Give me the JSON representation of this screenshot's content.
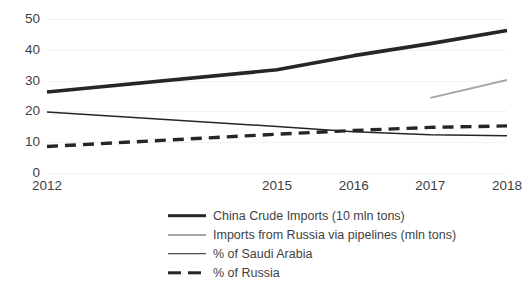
{
  "chart_data": {
    "type": "line",
    "title": "",
    "subtitle": "",
    "xlabel": "",
    "ylabel": "",
    "x": [
      "2012",
      "2015",
      "2016",
      "2017",
      "2018"
    ],
    "categories": [
      "2012",
      "2015",
      "2016",
      "2017",
      "2018"
    ],
    "xlim": [
      2012,
      2018
    ],
    "ylim": [
      0,
      50
    ],
    "yticks": [
      0,
      10,
      20,
      30,
      40,
      50
    ],
    "ytick_labels": [
      "0",
      "10",
      "20",
      "30",
      "40",
      "50"
    ],
    "xtick_labels": [
      "2012",
      "2015",
      "2016",
      "2017",
      "2018"
    ],
    "grid": "horizontal",
    "legend_position": "bottom",
    "series": [
      {
        "name": "China Crude Imports (10 mln tons)",
        "style": "solid-thick",
        "color": "#262626",
        "x": [
          2012,
          2015,
          2016,
          2017,
          2018
        ],
        "values": [
          26.3,
          33.5,
          38.1,
          42.0,
          46.3
        ]
      },
      {
        "name": "Imports from Russia via pipelines (mln tons)",
        "style": "solid-gray",
        "color": "#a6a6a6",
        "x": [
          2017,
          2018
        ],
        "values": [
          24.4,
          30.2
        ]
      },
      {
        "name": "% of Saudi Arabia",
        "style": "solid-thin",
        "color": "#262626",
        "x": [
          2012,
          2015,
          2016,
          2017,
          2018
        ],
        "values": [
          19.8,
          15.1,
          13.4,
          12.4,
          12.1
        ]
      },
      {
        "name": "% of Russia",
        "style": "dashed",
        "color": "#262626",
        "x": [
          2012,
          2015,
          2016,
          2017,
          2018
        ],
        "values": [
          8.6,
          12.6,
          13.8,
          14.8,
          15.3
        ]
      }
    ]
  },
  "legend": {
    "items": [
      {
        "label": "China Crude Imports (10 mln tons)"
      },
      {
        "label": "Imports from Russia via pipelines (mln tons)"
      },
      {
        "label": "% of Saudi Arabia"
      },
      {
        "label": "% of Russia"
      }
    ]
  },
  "colors": {
    "primary": "#262626",
    "secondary": "#a6a6a6",
    "grid": "#f2f2f2",
    "text": "#3f3f3f",
    "background": "#ffffff"
  }
}
